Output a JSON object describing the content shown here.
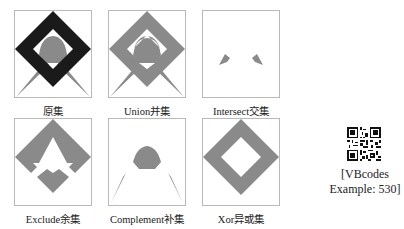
{
  "figure": {
    "panels": [
      {
        "id": "original",
        "label": "原集"
      },
      {
        "id": "union",
        "label": "Union并集"
      },
      {
        "id": "intersect",
        "label": "Intersect交集"
      },
      {
        "id": "exclude",
        "label": "Exclude余集"
      },
      {
        "id": "complement",
        "label": "Complement补集"
      },
      {
        "id": "xor",
        "label": "Xor异或集"
      }
    ],
    "colors": {
      "dark": "#1a1a1a",
      "grey": "#808080",
      "frame": "#b9b9b9"
    }
  },
  "qr": {
    "icon": "qr-code-icon",
    "caption_line1": "[VBcodes",
    "caption_line2": "Example: 530]"
  }
}
